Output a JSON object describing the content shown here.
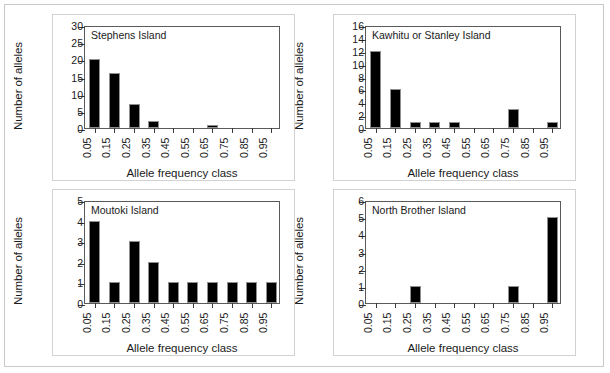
{
  "figure": {
    "xlabel": "Allele frequency class",
    "ylabel": "Number of alleles",
    "categories": [
      "0.05",
      "0.15",
      "0.25",
      "0.35",
      "0.45",
      "0.55",
      "0.65",
      "0.75",
      "0.85",
      "0.95"
    ],
    "bar_color": "#000000",
    "axis_color": "#5a5a5a",
    "frame_color": "#c9c9c9"
  },
  "chart_data": [
    {
      "type": "bar",
      "title": "Stephens Island",
      "xlabel": "Allele frequency class",
      "ylabel": "Number of alleles",
      "categories": [
        "0.05",
        "0.15",
        "0.25",
        "0.35",
        "0.45",
        "0.55",
        "0.65",
        "0.75",
        "0.85",
        "0.95"
      ],
      "values": [
        20,
        16,
        7,
        2,
        0,
        0,
        1,
        0,
        0,
        0
      ],
      "ylim": [
        0,
        30
      ],
      "ytick_step": 5,
      "yticks": [
        "0",
        "5",
        "10",
        "15",
        "20",
        "25",
        "30"
      ],
      "grid": false,
      "legend": "none"
    },
    {
      "type": "bar",
      "title": "Kawhitu or Stanley Island",
      "xlabel": "Allele frequency class",
      "ylabel": "Number of alleles",
      "categories": [
        "0.05",
        "0.15",
        "0.25",
        "0.35",
        "0.45",
        "0.55",
        "0.65",
        "0.75",
        "0.85",
        "0.95"
      ],
      "values": [
        12,
        6,
        1,
        1,
        1,
        0,
        0,
        3,
        0,
        1
      ],
      "ylim": [
        0,
        16
      ],
      "ytick_step": 2,
      "yticks": [
        "0",
        "2",
        "4",
        "6",
        "8",
        "10",
        "12",
        "14",
        "16"
      ],
      "grid": false,
      "legend": "none"
    },
    {
      "type": "bar",
      "title": "Moutoki Island",
      "xlabel": "Allele frequency class",
      "ylabel": "Number of alleles",
      "categories": [
        "0.05",
        "0.15",
        "0.25",
        "0.35",
        "0.45",
        "0.55",
        "0.65",
        "0.75",
        "0.85",
        "0.95"
      ],
      "values": [
        4,
        1,
        3,
        2,
        1,
        1,
        1,
        1,
        1,
        1
      ],
      "ylim": [
        0,
        5
      ],
      "ytick_step": 1,
      "yticks": [
        "0",
        "1",
        "2",
        "3",
        "4",
        "5"
      ],
      "grid": false,
      "legend": "none"
    },
    {
      "type": "bar",
      "title": "North Brother Island",
      "xlabel": "Allele frequency class",
      "ylabel": "Number of alleles",
      "categories": [
        "0.05",
        "0.15",
        "0.25",
        "0.35",
        "0.45",
        "0.55",
        "0.65",
        "0.75",
        "0.85",
        "0.95"
      ],
      "values": [
        0,
        0,
        1,
        0,
        0,
        0,
        0,
        1,
        0,
        5
      ],
      "ylim": [
        0,
        6
      ],
      "ytick_step": 1,
      "yticks": [
        "0",
        "1",
        "2",
        "3",
        "4",
        "5",
        "6"
      ],
      "grid": false,
      "legend": "none"
    }
  ]
}
